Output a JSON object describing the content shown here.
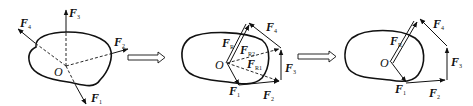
{
  "diagram": {
    "panels": [
      {
        "id": "original-forces",
        "point": "O",
        "forces": [
          {
            "name": "F",
            "sub": "1"
          },
          {
            "name": "F",
            "sub": "2"
          },
          {
            "name": "F",
            "sub": "3"
          },
          {
            "name": "F",
            "sub": "4"
          }
        ]
      },
      {
        "id": "force-polygon-with-intermediates",
        "point": "O",
        "forces": [
          {
            "name": "F",
            "sub": "1"
          },
          {
            "name": "F",
            "sub": "2"
          },
          {
            "name": "F",
            "sub": "3"
          },
          {
            "name": "F",
            "sub": "4"
          }
        ],
        "intermediates": [
          {
            "name": "F",
            "sub": "R1"
          },
          {
            "name": "F",
            "sub": "R2"
          }
        ],
        "resultant": {
          "name": "F",
          "sub": "R"
        }
      },
      {
        "id": "force-polygon-resultant",
        "point": "O",
        "forces": [
          {
            "name": "F",
            "sub": "1"
          },
          {
            "name": "F",
            "sub": "2"
          },
          {
            "name": "F",
            "sub": "3"
          },
          {
            "name": "F",
            "sub": "4"
          }
        ],
        "resultant": {
          "name": "F",
          "sub": "R"
        }
      }
    ],
    "transitions": [
      "double-arrow",
      "double-arrow"
    ],
    "colors": {
      "stroke": "#111111",
      "background": "#ffffff"
    }
  }
}
